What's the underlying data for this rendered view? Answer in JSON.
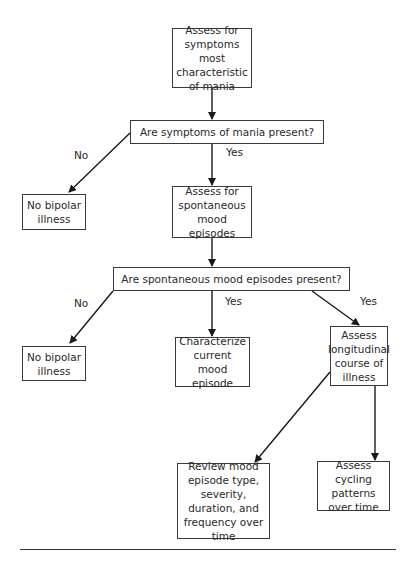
{
  "flowchart": {
    "nodes": {
      "assess_mania": "Assess for symptoms most characteristic of mania",
      "q_mania_present": "Are symptoms of mania present?",
      "no_bipolar_1": "No bipolar illness",
      "assess_spontaneous": "Assess for spontaneous mood episodes",
      "q_spontaneous_present": "Are spontaneous mood episodes present?",
      "no_bipolar_2": "No bipolar illness",
      "characterize_current": "Characterize current mood episode",
      "assess_longitudinal": "Assess longitudinal course of illness",
      "review_episodes": "Review mood episode type, severity, duration, and frequency over time",
      "assess_cycling": "Assess cycling patterns over time"
    },
    "edge_labels": {
      "q1_no": "No",
      "q1_yes": "Yes",
      "q2_no": "No",
      "q2_yes_center": "Yes",
      "q2_yes_right": "Yes"
    },
    "colors": {
      "line": "#2a2a2a",
      "background": "#ffffff"
    }
  }
}
